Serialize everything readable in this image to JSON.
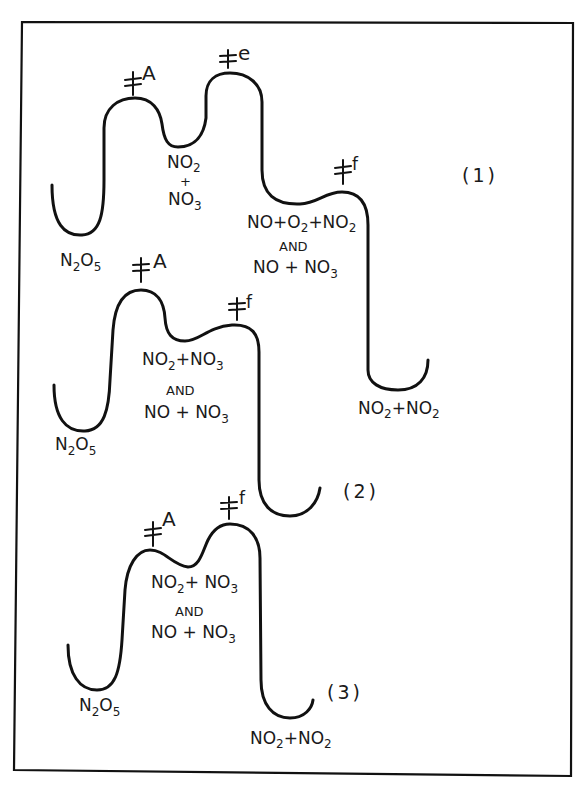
{
  "figure": {
    "type": "reaction energy profile diagrams",
    "panels": [
      {
        "id": "1",
        "tag": "(1)",
        "transition_states": [
          {
            "symbol": "‡",
            "label": "A"
          },
          {
            "symbol": "‡",
            "label": "e"
          },
          {
            "symbol": "‡",
            "label": "f"
          }
        ],
        "species": {
          "reactant": {
            "parts": [
              "N",
              "2",
              "O",
              "5"
            ]
          },
          "intermediate1": {
            "line1": [
              "NO",
              "2"
            ],
            "line2": "+",
            "line3": [
              "NO",
              "3"
            ]
          },
          "intermediate2": {
            "line1": [
              "NO+O",
              "2",
              "+NO",
              "2"
            ],
            "line2": "AND",
            "line3": [
              "NO + NO",
              "3"
            ]
          },
          "product": {
            "parts": [
              "NO",
              "2",
              "+NO",
              "2"
            ]
          }
        }
      },
      {
        "id": "2",
        "tag": "(2)",
        "transition_states": [
          {
            "symbol": "‡",
            "label": "A"
          },
          {
            "symbol": "‡",
            "label": "f"
          }
        ],
        "species": {
          "reactant": {
            "parts": [
              "N",
              "2",
              "O",
              "5"
            ]
          },
          "intermediate": {
            "line1": [
              "NO",
              "2",
              "+NO",
              "3"
            ],
            "line2": "AND",
            "line3": [
              "NO + NO",
              "3"
            ]
          }
        }
      },
      {
        "id": "3",
        "tag": "(3)",
        "transition_states": [
          {
            "symbol": "‡",
            "label": "A"
          },
          {
            "symbol": "‡",
            "label": "f"
          }
        ],
        "species": {
          "reactant": {
            "parts": [
              "N",
              "2",
              "O",
              "5"
            ]
          },
          "intermediate": {
            "line1": [
              "NO",
              "2",
              "+ NO",
              "3"
            ],
            "line2": "AND",
            "line3": [
              "NO + NO",
              "3"
            ]
          },
          "product": {
            "parts": [
              "NO",
              "2",
              "+NO",
              "2"
            ]
          }
        }
      }
    ]
  },
  "colors": {
    "ink": "#111111",
    "background": "#ffffff"
  }
}
